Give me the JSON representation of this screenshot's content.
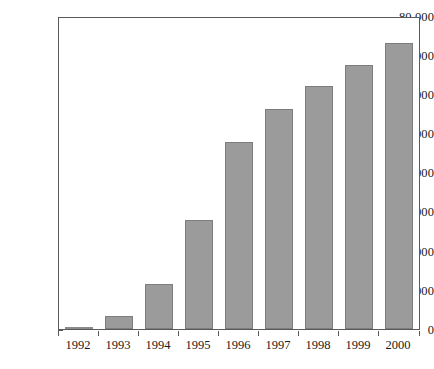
{
  "chart_data": {
    "type": "bar",
    "title": "",
    "subtitle": "",
    "xlabel": "",
    "ylabel": "",
    "categories": [
      "1992",
      "1993",
      "1994",
      "1995",
      "1996",
      "1997",
      "1998",
      "1999",
      "2000"
    ],
    "values": [
      350,
      3300,
      11500,
      28100,
      48200,
      56700,
      62400,
      68000,
      73600
    ],
    "series": [
      {
        "name": "",
        "values": [
          350,
          3300,
          11500,
          28100,
          48200,
          56700,
          62400,
          68000,
          73600
        ]
      }
    ],
    "ylim": [
      0,
      80000
    ],
    "ytick_values": [
      0,
      10000,
      20000,
      30000,
      40000,
      50000,
      60000,
      70000,
      80000
    ],
    "ytick_labels": [
      "0",
      "10 000",
      "20 000",
      "30 000",
      "40 000",
      "50 000",
      "60 000",
      "70 000",
      "80 000"
    ],
    "grid": false,
    "legend": null,
    "legend_position": "none",
    "annotations": [],
    "bar_color": "#9b9b9b",
    "bar_border_color": "#7d7d7d",
    "axis_color": "#5a5a5a",
    "background_color": "#ffffff"
  }
}
